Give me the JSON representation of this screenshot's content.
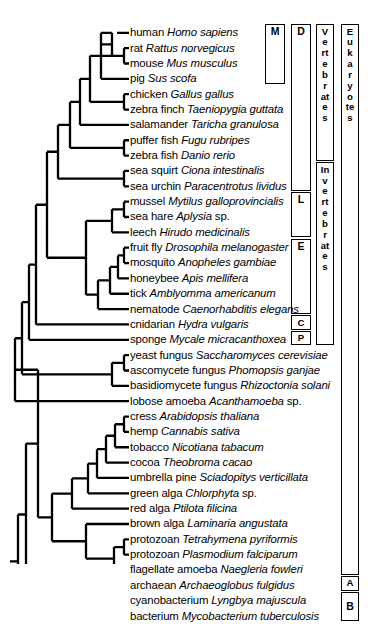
{
  "figure": {
    "type": "phylogenetic-cladogram",
    "title": "",
    "background_color": "#ffffff",
    "line_color": "#000000"
  },
  "taxa": [
    {
      "id": "human",
      "common": "human ",
      "sci": "Homo sapiens",
      "suffix": ""
    },
    {
      "id": "rat",
      "common": "rat ",
      "sci": "Rattus  norvegicus",
      "suffix": ""
    },
    {
      "id": "mouse",
      "common": "mouse ",
      "sci": "Mus musculus",
      "suffix": ""
    },
    {
      "id": "pig",
      "common": "pig ",
      "sci": "Sus scofa",
      "suffix": ""
    },
    {
      "id": "chicken",
      "common": "chicken ",
      "sci": "Gallus gallus",
      "suffix": ""
    },
    {
      "id": "zebra-finch",
      "common": "zebra finch ",
      "sci": "Taeniopygia guttata",
      "suffix": ""
    },
    {
      "id": "salamander",
      "common": "salamander ",
      "sci": "Taricha granulosa",
      "suffix": ""
    },
    {
      "id": "puffer-fish",
      "common": "puffer fish ",
      "sci": "Fugu rubripes",
      "suffix": ""
    },
    {
      "id": "zebra-fish",
      "common": "zebra fish ",
      "sci": "Danio rerio",
      "suffix": ""
    },
    {
      "id": "sea-squirt",
      "common": "sea squirt ",
      "sci": "Ciona intestinalis",
      "suffix": ""
    },
    {
      "id": "sea-urchin",
      "common": "sea urchin ",
      "sci": "Paracentrotus lividus",
      "suffix": ""
    },
    {
      "id": "mussel",
      "common": "mussel ",
      "sci": "Mytilus galloprovincialis",
      "suffix": ""
    },
    {
      "id": "sea-hare",
      "common": "sea hare ",
      "sci": "Aplysia",
      "suffix": " sp."
    },
    {
      "id": "leech",
      "common": "leech ",
      "sci": "Hirudo medicinalis",
      "suffix": ""
    },
    {
      "id": "fruit-fly",
      "common": "fruit fly ",
      "sci": "Drosophila melanogaster",
      "suffix": ""
    },
    {
      "id": "mosquito",
      "common": "mosquito ",
      "sci": "Anopheles gambiae",
      "suffix": ""
    },
    {
      "id": "honeybee",
      "common": "honeybee ",
      "sci": "Apis mellifera",
      "suffix": ""
    },
    {
      "id": "tick",
      "common": "tick ",
      "sci": "Amblyomma americanum",
      "suffix": ""
    },
    {
      "id": "nematode",
      "common": "nematode ",
      "sci": "Caenorhabditis elegans",
      "suffix": ""
    },
    {
      "id": "cnidarian",
      "common": "cnidarian ",
      "sci": "Hydra vulgaris",
      "suffix": ""
    },
    {
      "id": "sponge",
      "common": "sponge ",
      "sci": "Mycale micracanthoxea",
      "suffix": ""
    },
    {
      "id": "yeast-fungus",
      "common": "yeast fungus ",
      "sci": "Saccharomyces cerevisiae",
      "suffix": ""
    },
    {
      "id": "ascomycete",
      "common": "ascomycete fungus ",
      "sci": "Phomopsis ganjae",
      "suffix": ""
    },
    {
      "id": "basidiomycete",
      "common": "basidiomycete fungus ",
      "sci": "Rhizoctonia solani",
      "suffix": ""
    },
    {
      "id": "lobose-amoeba",
      "common": "lobose amoeba ",
      "sci": "Acanthamoeba",
      "suffix": " sp."
    },
    {
      "id": "cress",
      "common": "cress ",
      "sci": "Arabidopsis thaliana",
      "suffix": ""
    },
    {
      "id": "hemp",
      "common": "hemp ",
      "sci": "Cannabis sativa",
      "suffix": ""
    },
    {
      "id": "tobacco",
      "common": "tobacco ",
      "sci": "Nicotiana tabacum",
      "suffix": ""
    },
    {
      "id": "cocoa",
      "common": "cocoa ",
      "sci": "Theobroma cacao",
      "suffix": ""
    },
    {
      "id": "umbrella-pine",
      "common": "umbrella pine ",
      "sci": "Sciadopitys verticillata",
      "suffix": ""
    },
    {
      "id": "green-alga",
      "common": "green alga ",
      "sci": "Chlorphyta",
      "suffix": " sp."
    },
    {
      "id": "red-alga",
      "common": "red alga ",
      "sci": "Ptilota filicina",
      "suffix": ""
    },
    {
      "id": "brown-alga",
      "common": "brown alga ",
      "sci": "Laminaria angustata",
      "suffix": ""
    },
    {
      "id": "protozoan-tetra",
      "common": "protozoan ",
      "sci": "Tetrahymena pyriformis",
      "suffix": ""
    },
    {
      "id": "protozoan-plasmo",
      "common": "protozoan ",
      "sci": "Plasmodium falciparum",
      "suffix": ""
    },
    {
      "id": "flagellate",
      "common": "flagellate amoeba ",
      "sci": "Naegleria fowleri",
      "suffix": ""
    },
    {
      "id": "archaean",
      "common": "archaean ",
      "sci": "Archaeoglobus fulgidus",
      "suffix": ""
    },
    {
      "id": "cyanobacterium",
      "common": "cyanobacterium ",
      "sci": "Lyngbya majuscula",
      "suffix": ""
    },
    {
      "id": "bacterium",
      "common": "bacterium ",
      "sci": "Mycobacterium tuberculosis",
      "suffix": ""
    }
  ],
  "brackets": [
    {
      "id": "mammals",
      "label": "M",
      "column": 1,
      "orientation": "letter"
    },
    {
      "id": "deuterostomes",
      "label": "D",
      "column": 2,
      "orientation": "letter"
    },
    {
      "id": "lophotrochozoa",
      "label": "L",
      "column": 2,
      "orientation": "letter"
    },
    {
      "id": "ecdysozoa",
      "label": "E",
      "column": 2,
      "orientation": "letter"
    },
    {
      "id": "cnidaria",
      "label": "C",
      "column": 2,
      "orientation": "letter"
    },
    {
      "id": "porifera",
      "label": "P",
      "column": 2,
      "orientation": "letter"
    },
    {
      "id": "vertebrates",
      "label": "Vertebrates",
      "column": 3,
      "orientation": "vertical"
    },
    {
      "id": "invertebrates",
      "label": "Invertebrates",
      "column": 3,
      "orientation": "vertical"
    },
    {
      "id": "eukaryotes",
      "label": "Eukaryotes",
      "column": 4,
      "orientation": "vertical"
    },
    {
      "id": "archaea",
      "label": "A",
      "column": 4,
      "orientation": "letter"
    },
    {
      "id": "bacteria",
      "label": "B",
      "column": 4,
      "orientation": "letter"
    }
  ]
}
